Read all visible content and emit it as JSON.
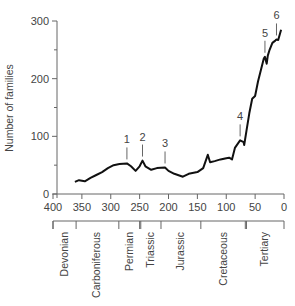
{
  "chart_data": {
    "type": "line",
    "title": "",
    "xlabel": "",
    "ylabel": "Number of families",
    "xlim": [
      400,
      0
    ],
    "ylim": [
      0,
      300
    ],
    "x_ticks": [
      400,
      350,
      300,
      250,
      200,
      150,
      100,
      50,
      0
    ],
    "y_ticks": [
      0,
      100,
      200,
      300
    ],
    "y_minor_ticks": [
      50,
      150,
      250
    ],
    "grid": false,
    "series": [
      {
        "name": "Number of families",
        "x": [
          362,
          355,
          345,
          335,
          325,
          315,
          305,
          295,
          285,
          272,
          265,
          257,
          250,
          245,
          240,
          230,
          220,
          206,
          200,
          190,
          175,
          165,
          150,
          140,
          132,
          128,
          120,
          110,
          100,
          95,
          90,
          85,
          76,
          70,
          69,
          65,
          60,
          55,
          50,
          45,
          40,
          35,
          33,
          30,
          28,
          25,
          20,
          15,
          13,
          10,
          5
        ],
        "y": [
          21,
          24,
          22,
          28,
          33,
          38,
          45,
          50,
          52,
          53,
          48,
          40,
          48,
          58,
          48,
          42,
          45,
          46,
          40,
          35,
          30,
          35,
          38,
          45,
          68,
          55,
          57,
          60,
          62,
          63,
          60,
          80,
          93,
          90,
          85,
          110,
          140,
          165,
          170,
          195,
          215,
          235,
          238,
          226,
          240,
          250,
          262,
          266,
          268,
          267,
          285
        ]
      }
    ],
    "annotations": [
      {
        "label": "1",
        "x": 272,
        "y": 53
      },
      {
        "label": "2",
        "x": 245,
        "y": 58
      },
      {
        "label": "3",
        "x": 206,
        "y": 46
      },
      {
        "label": "4",
        "x": 76,
        "y": 93
      },
      {
        "label": "5",
        "x": 33,
        "y": 238
      },
      {
        "label": "6",
        "x": 13,
        "y": 268
      }
    ],
    "periods": [
      {
        "name": "Devonian",
        "start": 400,
        "end": 360
      },
      {
        "name": "Carboniferous",
        "start": 360,
        "end": 286
      },
      {
        "name": "Permian",
        "start": 286,
        "end": 248
      },
      {
        "name": "Triassic",
        "start": 248,
        "end": 213
      },
      {
        "name": "Jurassic",
        "start": 213,
        "end": 144
      },
      {
        "name": "Cretaceous",
        "start": 144,
        "end": 65
      },
      {
        "name": "Tertiary",
        "start": 65,
        "end": 0
      }
    ]
  }
}
